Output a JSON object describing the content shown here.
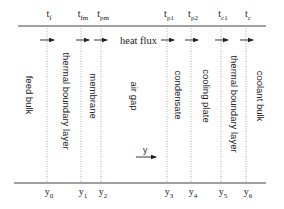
{
  "diagram": {
    "heat_flux_label": "heat flux",
    "direction_label": "y",
    "top_labels": [
      {
        "base": "t",
        "sub": "f"
      },
      {
        "base": "t",
        "sub": "fm"
      },
      {
        "base": "t",
        "sub": "pm"
      },
      {
        "base": "t",
        "sub": "p1"
      },
      {
        "base": "t",
        "sub": "p2"
      },
      {
        "base": "t",
        "sub": "c1"
      },
      {
        "base": "t",
        "sub": "c"
      }
    ],
    "bottom_labels": [
      {
        "base": "y",
        "sub": "0"
      },
      {
        "base": "y",
        "sub": "1"
      },
      {
        "base": "y",
        "sub": "2"
      },
      {
        "base": "y",
        "sub": "3"
      },
      {
        "base": "y",
        "sub": "4"
      },
      {
        "base": "y",
        "sub": "5"
      },
      {
        "base": "y",
        "sub": "6"
      }
    ],
    "regions": [
      "feed bulk",
      "thermal boundary layer",
      "membrane",
      "air gap",
      "condensate",
      "cooling plate",
      "thermal boundary layer",
      "coolant bulk"
    ]
  }
}
